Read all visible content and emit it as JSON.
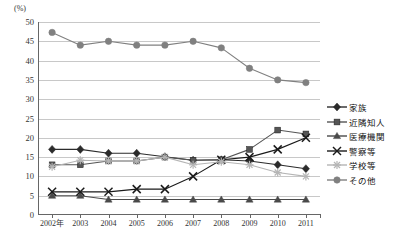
{
  "chart_data": {
    "type": "line",
    "title": "",
    "subtitle": "",
    "xlabel": "",
    "ylabel": "(%)",
    "unit_label": "(%)",
    "grid": true,
    "legend_position": "right",
    "categories": [
      "2002年",
      "2003",
      "2004",
      "2005",
      "2006",
      "2007",
      "2008",
      "2009",
      "2010",
      "2011"
    ],
    "ylim": [
      0,
      50
    ],
    "yticks": [
      0,
      5,
      10,
      15,
      20,
      25,
      30,
      35,
      40,
      45,
      50
    ],
    "series": [
      {
        "name": "家族",
        "marker": "diamond",
        "color": "#2b2b2b",
        "values": [
          17.0,
          17.0,
          16.0,
          16.0,
          15.1,
          14.2,
          14.3,
          14.0,
          13.0,
          12.0
        ]
      },
      {
        "name": "近隣知人",
        "marker": "square",
        "color": "#555555",
        "values": [
          13.0,
          13.0,
          14.0,
          14.0,
          15.0,
          14.2,
          14.3,
          17.0,
          22.0,
          21.0
        ]
      },
      {
        "name": "医療機関",
        "marker": "triangle",
        "color": "#4a4a4a",
        "values": [
          5.0,
          5.0,
          4.0,
          4.0,
          4.0,
          4.0,
          4.0,
          4.0,
          4.0,
          4.0
        ]
      },
      {
        "name": "警察等",
        "marker": "cross",
        "color": "#1a1a1a",
        "values": [
          6.0,
          6.0,
          6.0,
          6.7,
          6.7,
          10.0,
          14.3,
          15.0,
          17.0,
          20.0
        ]
      },
      {
        "name": "学校等",
        "marker": "asterisk",
        "color": "#b5b5b5",
        "values": [
          12.5,
          14.2,
          14.0,
          14.0,
          15.0,
          13.0,
          13.8,
          13.0,
          11.0,
          10.0
        ]
      },
      {
        "name": "その他",
        "marker": "circle",
        "color": "#808080",
        "values": [
          47.3,
          44.0,
          45.0,
          44.0,
          44.0,
          45.0,
          43.3,
          38.0,
          35.0,
          34.3
        ]
      }
    ]
  },
  "colors": {
    "grid": "#c8c8c8",
    "axis": "#666666",
    "text": "#333333",
    "background": "#ffffff"
  }
}
